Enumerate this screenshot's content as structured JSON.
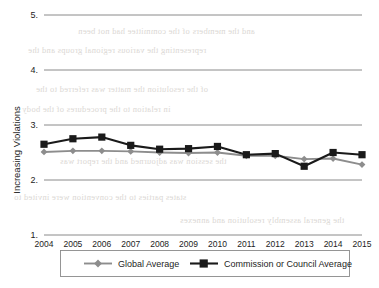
{
  "chart_data": {
    "type": "line",
    "title": "",
    "subtitle": "",
    "xlabel": "",
    "ylabel": "Increasing Violations",
    "categories": [
      "2004",
      "2005",
      "2006",
      "2007",
      "2008",
      "2009",
      "2010",
      "2011",
      "2012",
      "2013",
      "2014",
      "2015"
    ],
    "x": [
      2004,
      2005,
      2006,
      2007,
      2008,
      2009,
      2010,
      2011,
      2012,
      2013,
      2014,
      2015
    ],
    "xlim": [
      2004,
      2015
    ],
    "ylim": [
      1,
      5
    ],
    "yticks": [
      1,
      2,
      3,
      4,
      5
    ],
    "ytick_labels": [
      "1.",
      "2.",
      "3.",
      "4.",
      "5."
    ],
    "grid": "horizontal",
    "legend_position": "bottom",
    "series": [
      {
        "name": "Global Average",
        "color": "#8d8d8d",
        "marker": "diamond",
        "values": [
          2.51,
          2.53,
          2.53,
          2.52,
          2.5,
          2.49,
          2.5,
          2.44,
          2.44,
          2.38,
          2.39,
          2.28
        ]
      },
      {
        "name": "Commission or Council Average",
        "color": "#1a1a1a",
        "marker": "square",
        "values": [
          2.65,
          2.75,
          2.78,
          2.63,
          2.56,
          2.57,
          2.61,
          2.46,
          2.48,
          2.25,
          2.5,
          2.46
        ]
      }
    ]
  },
  "legend": {
    "entries": [
      {
        "label": "Global Average"
      },
      {
        "label": "Commission or Council Average"
      }
    ]
  },
  "scan_artifacts": {
    "bleed_lines": [
      "and the members of the committee had not been",
      "representing the various regional groups and the",
      "of the resolution the matter was referred to the",
      "in relation to the procedures of the body",
      "the session was adjourned and the report was",
      "states parties to the convention were invited to",
      "the general assembly resolution and annexes"
    ]
  }
}
